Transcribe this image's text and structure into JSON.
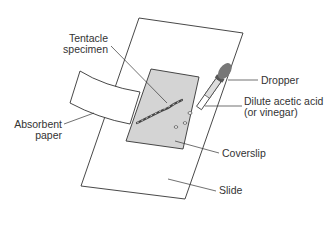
{
  "diagram": {
    "labels": {
      "tentacle_line1": "Tentacle",
      "tentacle_line2": "specimen",
      "dropper": "Dropper",
      "acid_line1": "Dilute acetic acid",
      "acid_line2": "(or vinegar)",
      "absorbent_line1": "Absorbent",
      "absorbent_line2": "paper",
      "coverslip": "Coverslip",
      "slide": "Slide"
    },
    "colors": {
      "outline": "#333333",
      "coverslip_fill": "#d4d4d4",
      "dropper_bulb": "#777777",
      "background": "#ffffff"
    }
  }
}
